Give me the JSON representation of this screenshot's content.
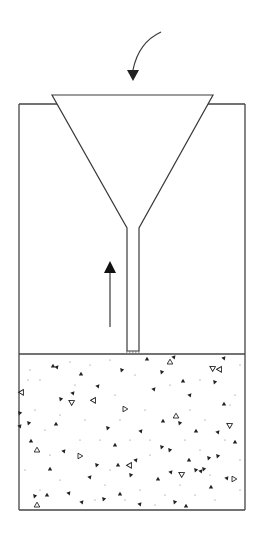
{
  "diagram": {
    "title": "",
    "colors": {
      "stroke": "#3a3a3a",
      "aggregate": "#222222",
      "background": "#ffffff"
    },
    "container": {
      "left": 19,
      "right": 245,
      "top": 104,
      "bottom": 510
    },
    "funnel": {
      "top_y": 95,
      "top_left_x": 52,
      "top_right_x": 213,
      "neck_y": 228,
      "neck_left_x": 127,
      "neck_right_x": 139,
      "stem_bottom_y": 351
    },
    "concrete_level_y": 354,
    "arrows": [
      {
        "id": "pour-arrow",
        "label": "",
        "direction": "down",
        "type": "curved"
      },
      {
        "id": "rise-arrow",
        "label": "",
        "direction": "up",
        "type": "straight"
      }
    ],
    "aggregate_filled": [
      [
        53,
        366
      ],
      [
        57,
        367
      ],
      [
        61,
        399
      ],
      [
        81,
        374
      ],
      [
        98,
        386
      ],
      [
        122,
        370
      ],
      [
        147,
        359
      ],
      [
        154,
        389
      ],
      [
        162,
        372
      ],
      [
        163,
        421
      ],
      [
        174,
        357
      ],
      [
        180,
        423
      ],
      [
        183,
        381
      ],
      [
        190,
        395
      ],
      [
        215,
        382
      ],
      [
        224,
        404
      ],
      [
        224,
        358
      ],
      [
        29,
        423
      ],
      [
        56,
        424
      ],
      [
        73,
        393
      ],
      [
        108,
        428
      ],
      [
        115,
        445
      ],
      [
        141,
        431
      ],
      [
        162,
        447
      ],
      [
        196,
        431
      ],
      [
        218,
        432
      ],
      [
        218,
        456
      ],
      [
        31,
        441
      ],
      [
        64,
        451
      ],
      [
        97,
        465
      ],
      [
        118,
        465
      ],
      [
        136,
        460
      ],
      [
        170,
        450
      ],
      [
        189,
        460
      ],
      [
        201,
        471
      ],
      [
        204,
        469
      ],
      [
        50,
        469
      ],
      [
        90,
        477
      ],
      [
        131,
        475
      ],
      [
        158,
        479
      ],
      [
        171,
        472
      ],
      [
        196,
        470
      ],
      [
        211,
        487
      ],
      [
        227,
        478
      ],
      [
        35,
        496
      ],
      [
        47,
        495
      ],
      [
        69,
        493
      ],
      [
        104,
        499
      ],
      [
        120,
        494
      ],
      [
        140,
        504
      ],
      [
        175,
        502
      ],
      [
        186,
        506
      ],
      [
        82,
        502
      ],
      [
        209,
        458
      ],
      [
        235,
        442
      ],
      [
        20,
        426
      ],
      [
        20,
        413
      ]
    ],
    "aggregate_hollow": [
      [
        170,
        362
      ],
      [
        220,
        369
      ],
      [
        72,
        402
      ],
      [
        125,
        409
      ],
      [
        176,
        416
      ],
      [
        22,
        392
      ],
      [
        230,
        425
      ],
      [
        80,
        456
      ],
      [
        37,
        450
      ],
      [
        130,
        465
      ],
      [
        182,
        474
      ],
      [
        234,
        479
      ],
      [
        37,
        505
      ],
      [
        94,
        400
      ],
      [
        213,
        368
      ]
    ],
    "aggregate_dots": [
      [
        30,
        370
      ],
      [
        40,
        380
      ],
      [
        70,
        362
      ],
      [
        90,
        365
      ],
      [
        110,
        360
      ],
      [
        135,
        375
      ],
      [
        145,
        410
      ],
      [
        200,
        380
      ],
      [
        240,
        365
      ],
      [
        35,
        410
      ],
      [
        85,
        420
      ],
      [
        100,
        440
      ],
      [
        120,
        420
      ],
      [
        150,
        440
      ],
      [
        190,
        410
      ],
      [
        230,
        405
      ],
      [
        25,
        470
      ],
      [
        60,
        480
      ],
      [
        80,
        440
      ],
      [
        105,
        485
      ],
      [
        140,
        490
      ],
      [
        165,
        495
      ],
      [
        195,
        495
      ],
      [
        215,
        500
      ],
      [
        240,
        490
      ],
      [
        45,
        430
      ],
      [
        65,
        510
      ],
      [
        150,
        455
      ],
      [
        185,
        440
      ],
      [
        240,
        460
      ],
      [
        28,
        380
      ],
      [
        115,
        395
      ],
      [
        205,
        420
      ],
      [
        95,
        500
      ],
      [
        60,
        415
      ],
      [
        130,
        440
      ],
      [
        170,
        385
      ],
      [
        225,
        440
      ],
      [
        50,
        455
      ],
      [
        110,
        470
      ],
      [
        155,
        505
      ],
      [
        200,
        450
      ],
      [
        75,
        385
      ],
      [
        235,
        395
      ],
      [
        180,
        485
      ],
      [
        40,
        490
      ],
      [
        125,
        500
      ],
      [
        210,
        475
      ]
    ]
  }
}
